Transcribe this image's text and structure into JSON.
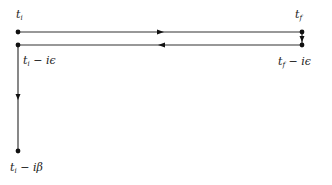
{
  "diagram": {
    "colors": {
      "line": "#333333",
      "dot": "#111111"
    },
    "nodes": [
      {
        "id": "ti",
        "x": 18,
        "y": 32,
        "label_base": "t",
        "label_sub": "i",
        "label_suffix": ""
      },
      {
        "id": "tf",
        "x": 302,
        "y": 32,
        "label_base": "t",
        "label_sub": "f",
        "label_suffix": ""
      },
      {
        "id": "tf_minus_ieps",
        "x": 302,
        "y": 45,
        "label_base": "t",
        "label_sub": "f",
        "label_suffix": " − iϵ"
      },
      {
        "id": "ti_minus_ieps",
        "x": 18,
        "y": 45,
        "label_base": "t",
        "label_sub": "i",
        "label_suffix": " − iϵ"
      },
      {
        "id": "ti_minus_ibeta",
        "x": 18,
        "y": 151,
        "label_base": "t",
        "label_sub": "i",
        "label_suffix": " − iβ"
      }
    ],
    "edges": [
      {
        "from": "ti",
        "to": "tf",
        "arrow": "right"
      },
      {
        "from": "tf",
        "to": "tf_minus_ieps",
        "arrow": "down"
      },
      {
        "from": "tf_minus_ieps",
        "to": "ti_minus_ieps",
        "arrow": "left"
      },
      {
        "from": "ti_minus_ieps",
        "to": "ti_minus_ibeta",
        "arrow": "down"
      }
    ]
  }
}
